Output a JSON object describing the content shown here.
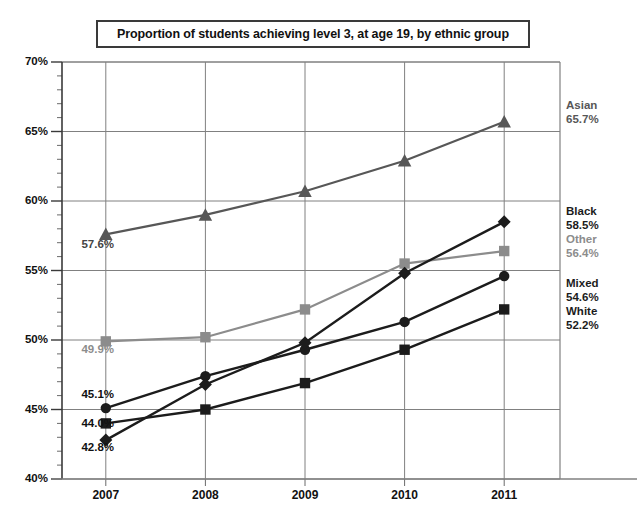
{
  "chart_data": {
    "type": "line",
    "title": "Proportion of students achieving level 3, at age 19, by ethnic group",
    "xlabel": "",
    "ylabel": "",
    "categories": [
      "2007",
      "2008",
      "2009",
      "2010",
      "2011"
    ],
    "x": [
      2007,
      2008,
      2009,
      2010,
      2011
    ],
    "ylim": [
      40,
      70
    ],
    "ytick_labels": [
      "40%",
      "45%",
      "50%",
      "55%",
      "60%",
      "65%",
      "70%"
    ],
    "ytick_values": [
      40,
      45,
      50,
      55,
      60,
      65,
      70
    ],
    "y_minor_tick_step": 1,
    "y_unit": "%",
    "grid": true,
    "legend_position": "right-inline-labels",
    "series": [
      {
        "name": "Asian",
        "marker": "triangle",
        "color": "#575757",
        "values": [
          57.6,
          59.0,
          60.7,
          62.9,
          65.7
        ],
        "start_label": "57.6%",
        "end_label": "65.7%"
      },
      {
        "name": "Black",
        "marker": "diamond",
        "color": "#1c1c1c",
        "values": [
          42.8,
          46.8,
          49.8,
          54.8,
          58.5
        ],
        "start_label": "42.8%",
        "end_label": "58.5%"
      },
      {
        "name": "Other",
        "marker": "square",
        "color": "#8c8c8c",
        "values": [
          49.9,
          50.2,
          52.2,
          55.5,
          56.4
        ],
        "start_label": "49.9%",
        "end_label": "56.4%"
      },
      {
        "name": "Mixed",
        "marker": "circle",
        "color": "#1c1c1c",
        "values": [
          45.1,
          47.4,
          49.3,
          51.3,
          54.6
        ],
        "start_label": "45.1%",
        "end_label": "54.6%"
      },
      {
        "name": "White",
        "marker": "square",
        "color": "#1c1c1c",
        "values": [
          44.0,
          45.0,
          46.9,
          49.3,
          52.2
        ],
        "start_label": "44.0%",
        "end_label": "52.2%"
      }
    ]
  },
  "axis": {
    "yticks": [
      {
        "label": "70%"
      },
      {
        "label": "65%"
      },
      {
        "label": "60%"
      },
      {
        "label": "55%"
      },
      {
        "label": "50%"
      },
      {
        "label": "45%"
      },
      {
        "label": "40%"
      }
    ],
    "xticks": [
      {
        "label": "2007"
      },
      {
        "label": "2008"
      },
      {
        "label": "2009"
      },
      {
        "label": "2010"
      },
      {
        "label": "2011"
      }
    ]
  },
  "right_labels": [
    {
      "name": "Asian",
      "value": "65.7%",
      "color": "#575757"
    },
    {
      "name": "Black",
      "value": "58.5%",
      "color": "#1c1c1c"
    },
    {
      "name": "Other",
      "value": "56.4%",
      "color": "#8c8c8c"
    },
    {
      "name": "Mixed",
      "value": "54.6%",
      "color": "#1c1c1c"
    },
    {
      "name": "White",
      "value": "52.2%",
      "color": "#1c1c1c"
    }
  ],
  "left_labels": [
    {
      "value": "57.6%",
      "color": "#444444"
    },
    {
      "value": "49.9%",
      "color": "#8c8c8c"
    },
    {
      "value": "45.1%",
      "color": "#111111"
    },
    {
      "value": "44.0%",
      "color": "#111111"
    },
    {
      "value": "42.8%",
      "color": "#111111"
    }
  ]
}
